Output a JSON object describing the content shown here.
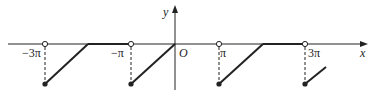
{
  "figure": {
    "axis_labels": {
      "x": "x",
      "y": "y",
      "origin": "O"
    },
    "tick_labels": [
      "−3π",
      "−π",
      "π",
      "3π"
    ],
    "colors": {
      "stroke": "#222222",
      "background": "#ffffff"
    }
  }
}
